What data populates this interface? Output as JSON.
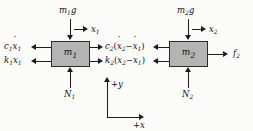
{
  "diagram": {
    "background_color": "#fbfbfa",
    "line_color": "#1c1c1c",
    "mass_fill_color": "#b4b4b4"
  },
  "masses": [
    {
      "id": "mass-1",
      "label_base": "m",
      "label_sub": "1"
    },
    {
      "id": "mass-2",
      "label_base": "m",
      "label_sub": "2"
    }
  ],
  "forces": {
    "gravity_1": {
      "base": "m",
      "sub": "1",
      "suffix": "g"
    },
    "gravity_2": {
      "base": "m",
      "sub": "2",
      "suffix": "g"
    },
    "normal_1": {
      "base": "N",
      "sub": "1"
    },
    "normal_2": {
      "base": "N",
      "sub": "2"
    },
    "damper_1": {
      "prefix": "c",
      "prefix_sub": "1",
      "var": "x",
      "var_sub": "1"
    },
    "spring_1": {
      "prefix": "k",
      "prefix_sub": "1",
      "var": "x",
      "var_sub": "1"
    },
    "damper_2": {
      "prefix": "c",
      "prefix_sub": "2",
      "open": "(",
      "v1": "x",
      "v1_sub": "2",
      "minus": "−",
      "v2": "x",
      "v2_sub": "1",
      "close": ")"
    },
    "spring_2": {
      "prefix": "k",
      "prefix_sub": "2",
      "open": "(",
      "v1": "x",
      "v1_sub": "2",
      "minus": "−",
      "v2": "x",
      "v2_sub": "1",
      "close": ")"
    },
    "applied_force": {
      "base": "f",
      "sub": "2"
    }
  },
  "displacements": [
    {
      "id": "disp-1",
      "base": "x",
      "sub": "1"
    },
    {
      "id": "disp-2",
      "base": "x",
      "sub": "2"
    }
  ],
  "axes": {
    "y_label": "+y",
    "x_label": "+x"
  }
}
